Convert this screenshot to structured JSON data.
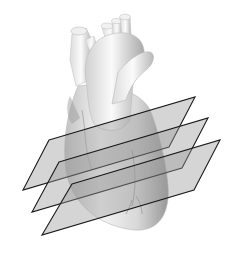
{
  "figure": {
    "plane_count": 3,
    "colors": {
      "background": "#ffffff",
      "heart_light": "#f2f2f2",
      "heart_mid": "#c8c8c8",
      "heart_dark": "#8e8e8e",
      "plane_fill": "#9a9a9a",
      "plane_stroke": "#1a1a1a"
    },
    "planes": [
      {
        "id": "plane-1",
        "points": "49,140 195,97 169,147 23,190"
      },
      {
        "id": "plane-2",
        "points": "59,162 208,118 182,168 32,212"
      },
      {
        "id": "plane-3",
        "points": "72,184 220,140 194,190 42,235"
      }
    ]
  }
}
